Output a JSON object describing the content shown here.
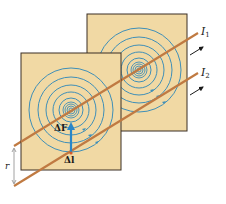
{
  "diagram": {
    "colors": {
      "panel_fill": "#f1d9a4",
      "panel_border": "#3b2f24",
      "field_lines": "#3f8fb8",
      "wire": "#c07a42",
      "force_vector": "#2a86c8",
      "text": "#1a1a1a"
    },
    "labels": {
      "current_1": "I",
      "current_1_sub": "1",
      "current_2": "I",
      "current_2_sub": "2",
      "force": "ΔF",
      "length": "Δl",
      "separation": "r"
    },
    "panels": [
      {
        "name": "back-panel",
        "x": 87,
        "y": 14,
        "width": 100,
        "height": 117
      },
      {
        "name": "front-panel",
        "x": 21,
        "y": 53,
        "width": 100,
        "height": 117
      }
    ],
    "wires": [
      {
        "name": "wire-1",
        "x1": 14,
        "y1": 146,
        "x2": 198,
        "y2": 33
      },
      {
        "name": "wire-2",
        "x1": 14,
        "y1": 186,
        "x2": 198,
        "y2": 73
      }
    ]
  }
}
